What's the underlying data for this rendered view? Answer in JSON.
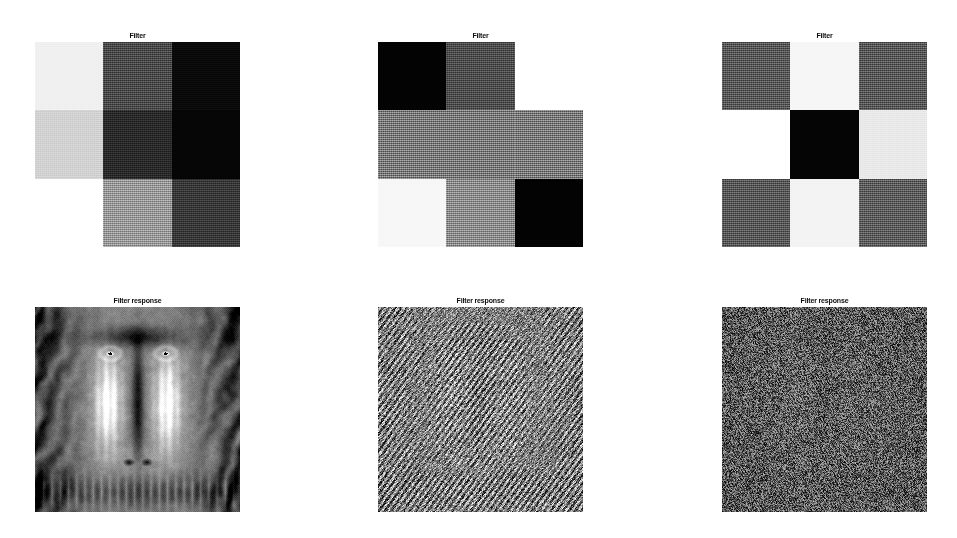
{
  "figure": {
    "width": 957,
    "height": 538,
    "background": "#ffffff",
    "layout": "2 rows x 3 columns of image panels",
    "rows": 2,
    "columns": 3
  },
  "panels": [
    {
      "id": "filter-1",
      "title": "Filter",
      "row": 0,
      "column": 0,
      "kind": "filter-kernel",
      "x": 35,
      "y": 31,
      "size": 205,
      "grid": {
        "rows": 3,
        "cols": 3,
        "cells": [
          [
            {
              "name": "r0c0",
              "gray": "#f0f0f0",
              "value": 0.94,
              "noise": "soft"
            },
            {
              "name": "r0c1",
              "gray": "#4c4c4c",
              "value": 0.3,
              "noise": "strong"
            },
            {
              "name": "r0c2",
              "gray": "#0a0a0a",
              "value": 0.04,
              "noise": "strong"
            }
          ],
          [
            {
              "name": "r1c0",
              "gray": "#d2d2d2",
              "value": 0.82,
              "noise": "soft"
            },
            {
              "name": "r1c1",
              "gray": "#2b2b2b",
              "value": 0.17,
              "noise": "strong"
            },
            {
              "name": "r1c2",
              "gray": "#050505",
              "value": 0.02,
              "noise": "soft"
            }
          ],
          [
            {
              "name": "r2c0",
              "gray": "#ffffff",
              "value": 1.0,
              "noise": "none"
            },
            {
              "name": "r2c1",
              "gray": "#9a9a9a",
              "value": 0.6,
              "noise": "strong"
            },
            {
              "name": "r2c2",
              "gray": "#3a3a3a",
              "value": 0.23,
              "noise": "strong"
            }
          ]
        ]
      }
    },
    {
      "id": "filter-2",
      "title": "Filter",
      "row": 0,
      "column": 1,
      "kind": "filter-kernel",
      "x": 378,
      "y": 31,
      "size": 205,
      "grid": {
        "rows": 3,
        "cols": 3,
        "cells": [
          [
            {
              "name": "r0c0",
              "gray": "#030303",
              "value": 0.01,
              "noise": "none"
            },
            {
              "name": "r0c1",
              "gray": "#4f4f4f",
              "value": 0.31,
              "noise": "strong"
            },
            {
              "name": "r0c2",
              "gray": "#ffffff",
              "value": 1.0,
              "noise": "none"
            }
          ],
          [
            {
              "name": "r1c0",
              "gray": "#7c7c7c",
              "value": 0.49,
              "noise": "strong"
            },
            {
              "name": "r1c1",
              "gray": "#7c7c7c",
              "value": 0.49,
              "noise": "strong"
            },
            {
              "name": "r1c2",
              "gray": "#7c7c7c",
              "value": 0.49,
              "noise": "strong"
            }
          ],
          [
            {
              "name": "r2c0",
              "gray": "#f7f7f7",
              "value": 0.97,
              "noise": "soft"
            },
            {
              "name": "r2c1",
              "gray": "#8e8e8e",
              "value": 0.56,
              "noise": "strong"
            },
            {
              "name": "r2c2",
              "gray": "#030303",
              "value": 0.01,
              "noise": "none"
            }
          ]
        ]
      }
    },
    {
      "id": "filter-3",
      "title": "Filter",
      "row": 0,
      "column": 2,
      "kind": "filter-kernel",
      "x": 722,
      "y": 31,
      "size": 205,
      "grid": {
        "rows": 3,
        "cols": 3,
        "cells": [
          [
            {
              "name": "r0c0",
              "gray": "#5a5a5a",
              "value": 0.35,
              "noise": "strong"
            },
            {
              "name": "r0c1",
              "gray": "#f6f6f6",
              "value": 0.96,
              "noise": "soft"
            },
            {
              "name": "r0c2",
              "gray": "#5a5a5a",
              "value": 0.35,
              "noise": "strong"
            }
          ],
          [
            {
              "name": "r1c0",
              "gray": "#ffffff",
              "value": 1.0,
              "noise": "none"
            },
            {
              "name": "r1c1",
              "gray": "#050505",
              "value": 0.02,
              "noise": "none"
            },
            {
              "name": "r1c2",
              "gray": "#e9e9e9",
              "value": 0.91,
              "noise": "soft"
            }
          ],
          [
            {
              "name": "r2c0",
              "gray": "#5a5a5a",
              "value": 0.35,
              "noise": "strong"
            },
            {
              "name": "r2c1",
              "gray": "#f3f3f3",
              "value": 0.95,
              "noise": "soft"
            },
            {
              "name": "r2c2",
              "gray": "#5f5f5f",
              "value": 0.37,
              "noise": "strong"
            }
          ]
        ]
      }
    },
    {
      "id": "response-1",
      "title": "Filter response",
      "row": 1,
      "column": 0,
      "kind": "response-image",
      "x": 35,
      "y": 296,
      "size": 205,
      "image": {
        "subject": "mandrill-baboon-face",
        "description": "grayscale mandrill face, sharp detail, full tonal range",
        "style": "sharp",
        "mean_gray": 0.52,
        "contrast": 1.0,
        "noise_amount": 0.1
      }
    },
    {
      "id": "response-2",
      "title": "Filter response",
      "row": 1,
      "column": 1,
      "kind": "response-image",
      "x": 378,
      "y": 296,
      "size": 205,
      "image": {
        "subject": "mandrill-baboon-face",
        "description": "high-frequency edge response of mandrill, mid-gray with fine texture",
        "style": "edge-response",
        "mean_gray": 0.5,
        "contrast": 0.3,
        "noise_amount": 0.34
      }
    },
    {
      "id": "response-3",
      "title": "Filter response",
      "row": 1,
      "column": 2,
      "kind": "response-image",
      "x": 722,
      "y": 296,
      "size": 205,
      "image": {
        "subject": "mandrill-baboon-face",
        "description": "near-uniform dark noise field, faint residual structure",
        "style": "noise-field",
        "mean_gray": 0.36,
        "contrast": 0.12,
        "noise_amount": 0.42
      }
    }
  ]
}
